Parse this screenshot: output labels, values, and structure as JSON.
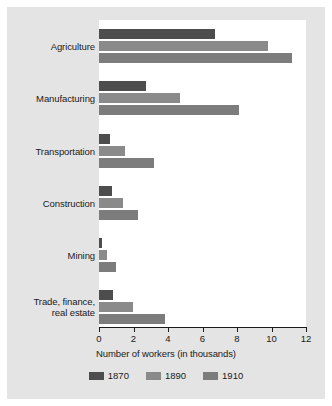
{
  "chart_data": {
    "type": "bar",
    "orientation": "horizontal",
    "title": "",
    "xlabel": "Number of workers (in thousands)",
    "ylabel": "",
    "xlim": [
      0,
      12
    ],
    "xticks": [
      "0",
      "2",
      "4",
      "6",
      "8",
      "10",
      "12"
    ],
    "grid": false,
    "legend_position": "bottom",
    "categories": [
      "Agriculture",
      "Manufacturing",
      "Transportation",
      "Construction",
      "Mining",
      "Trade, finance,\nreal estate"
    ],
    "series": [
      {
        "name": "1870",
        "color": "#4d4d4d",
        "values": [
          6.7,
          2.7,
          0.65,
          0.75,
          0.15,
          0.8
        ]
      },
      {
        "name": "1890",
        "color": "#8a8a8a",
        "values": [
          9.8,
          4.7,
          1.5,
          1.4,
          0.45,
          1.95
        ]
      },
      {
        "name": "1910",
        "color": "#7c7c7c",
        "values": [
          11.2,
          8.1,
          3.2,
          2.25,
          1.0,
          3.85
        ]
      }
    ]
  },
  "figure": {
    "panel_color": "#e4e4e4",
    "plot_background": "#ffffff",
    "axis_color": "#1a1a1a",
    "text_color": "#1a1a1a"
  }
}
